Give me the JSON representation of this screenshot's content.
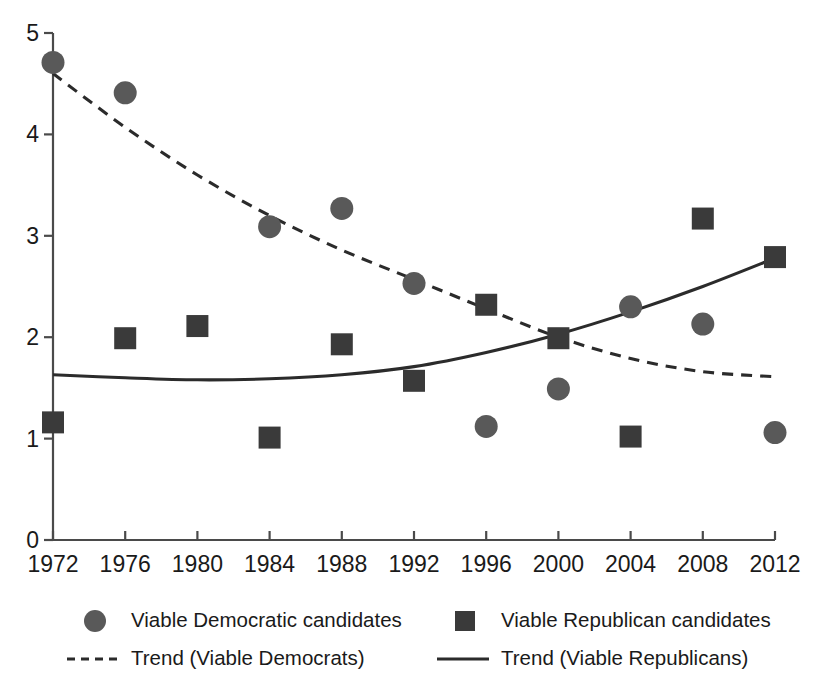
{
  "chart_data": {
    "type": "scatter",
    "title": "",
    "xlabel": "",
    "ylabel": "",
    "x": [
      1972,
      1976,
      1980,
      1984,
      1988,
      1992,
      1996,
      2000,
      2004,
      2008,
      2012
    ],
    "xticklabels": [
      "1972",
      "1976",
      "1980",
      "1984",
      "1988",
      "1992",
      "1996",
      "2000",
      "2004",
      "2008",
      "2012"
    ],
    "yticklabels": [
      "0",
      "1",
      "2",
      "3",
      "4",
      "5"
    ],
    "yticks": [
      0,
      1,
      2,
      3,
      4,
      5
    ],
    "xlim": [
      1972,
      2012
    ],
    "ylim": [
      0,
      5
    ],
    "grid": false,
    "legend_position": "bottom",
    "series": [
      {
        "name": "Viable Democratic candidates",
        "marker": "circle",
        "color": "#595959",
        "values": [
          4.71,
          4.41,
          null,
          3.09,
          3.27,
          2.53,
          1.12,
          1.49,
          2.3,
          2.13,
          1.06
        ]
      },
      {
        "name": "Viable Republican candidates",
        "marker": "square",
        "color": "#3a3a3a",
        "values": [
          1.16,
          1.99,
          2.11,
          1.01,
          1.93,
          1.57,
          2.32,
          1.99,
          1.02,
          3.17,
          2.79
        ]
      },
      {
        "name": "Trend (Viable Democrats)",
        "marker": "dashed-line",
        "color": "#2b2b2b",
        "values": [
          4.6,
          4.07,
          3.6,
          3.2,
          2.86,
          2.57,
          2.28,
          2.0,
          1.79,
          1.66,
          1.61
        ]
      },
      {
        "name": "Trend (Viable Republicans)",
        "marker": "solid-line",
        "color": "#2b2b2b",
        "values": [
          1.63,
          1.6,
          1.58,
          1.59,
          1.63,
          1.71,
          1.85,
          2.03,
          2.25,
          2.5,
          2.78
        ]
      }
    ]
  },
  "legend": {
    "items": [
      {
        "label": "Viable Democratic candidates",
        "marker": "circle"
      },
      {
        "label": "Viable Republican candidates",
        "marker": "square"
      },
      {
        "label": "Trend (Viable Democrats)",
        "marker": "dashed-line"
      },
      {
        "label": "Trend (Viable Republicans)",
        "marker": "solid-line"
      }
    ]
  },
  "axis": {
    "y_top_label": "5",
    "y_bottom_label": "0"
  }
}
